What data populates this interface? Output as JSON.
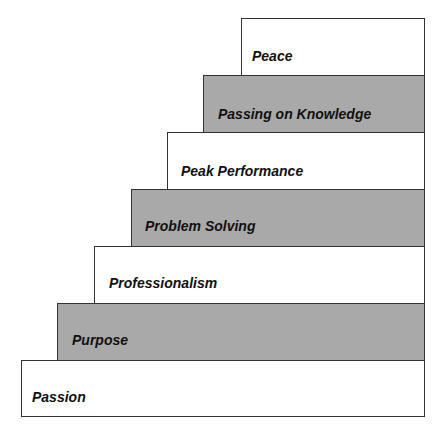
{
  "diagram": {
    "type": "staircase",
    "fill_colors": {
      "white": "#ffffff",
      "gray": "#a9a9a9"
    },
    "steps": [
      {
        "label": "Peace",
        "fill": "white"
      },
      {
        "label": "Passing on Knowledge",
        "fill": "gray"
      },
      {
        "label": "Peak Performance",
        "fill": "white"
      },
      {
        "label": "Problem Solving",
        "fill": "gray"
      },
      {
        "label": "Professionalism",
        "fill": "white"
      },
      {
        "label": "Purpose",
        "fill": "gray"
      },
      {
        "label": "Passion",
        "fill": "white"
      }
    ]
  }
}
